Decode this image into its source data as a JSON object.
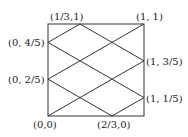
{
  "diagram": {
    "square": {
      "x0": 0,
      "y0": 0,
      "x1": 1,
      "y1": 1
    },
    "labels": [
      {
        "id": "p00",
        "text": "(0,0)",
        "u": 0,
        "v": 0,
        "dx": -15,
        "dy": 12
      },
      {
        "id": "p23_0",
        "text": "(2/3,0)",
        "u": 0.6667,
        "v": 0,
        "dx": -15,
        "dy": 12
      },
      {
        "id": "p13_1",
        "text": "(1/3,1)",
        "u": 0.3333,
        "v": 1,
        "dx": -30,
        "dy": -4
      },
      {
        "id": "p11",
        "text": "(1, 1)",
        "u": 1,
        "v": 1,
        "dx": -8,
        "dy": -4
      },
      {
        "id": "p0_45",
        "text": "(0, 4/5)",
        "u": 0,
        "v": 0.8,
        "dx": -40,
        "dy": 4
      },
      {
        "id": "p0_25",
        "text": "(0, 2/5)",
        "u": 0,
        "v": 0.4,
        "dx": -40,
        "dy": 4
      },
      {
        "id": "p1_35",
        "text": "(1, 3/5)",
        "u": 1,
        "v": 0.6,
        "dx": 2,
        "dy": 4
      },
      {
        "id": "p1_15",
        "text": "(1, 1/5)",
        "u": 1,
        "v": 0.2,
        "dx": 2,
        "dy": 4
      }
    ],
    "segments": [
      {
        "from": [
          0,
          0
        ],
        "to": [
          1,
          0.6
        ]
      },
      {
        "from": [
          0,
          0.4
        ],
        "to": [
          1,
          1
        ]
      },
      {
        "from": [
          0.6667,
          0
        ],
        "to": [
          1,
          0.2
        ]
      },
      {
        "from": [
          0,
          0.8
        ],
        "to": [
          0.3333,
          1
        ]
      },
      {
        "from": [
          0.3333,
          1
        ],
        "to": [
          1,
          0.6
        ]
      },
      {
        "from": [
          0,
          0.8
        ],
        "to": [
          1,
          0.2
        ]
      },
      {
        "from": [
          0,
          0.4
        ],
        "to": [
          0.6667,
          0
        ]
      }
    ],
    "stroke_color": "#333333"
  }
}
